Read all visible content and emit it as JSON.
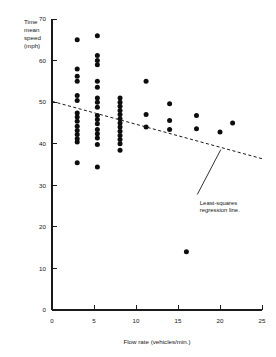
{
  "chart_data": {
    "type": "scatter",
    "title": "",
    "xlabel": "Flow rate (vehicles/min.)",
    "ylabel": "Time mean speed (mph)",
    "ylabel_lines": [
      "Time",
      "mean",
      "speed",
      "(mph)"
    ],
    "xlim": [
      0,
      25
    ],
    "ylim": [
      0,
      70
    ],
    "xticks": [
      0,
      5,
      10,
      15,
      20,
      25
    ],
    "yticks": [
      0,
      10,
      20,
      30,
      40,
      50,
      60,
      70
    ],
    "xtick_labels": [
      "0",
      "5",
      "10",
      "15",
      "20",
      "25"
    ],
    "ytick_labels": [
      "0",
      "10",
      "20",
      "30",
      "40",
      "50",
      "60",
      "70"
    ],
    "grid": false,
    "legend": null,
    "annotations": [
      {
        "name": "regression-line-annotation",
        "text_lines": [
          "Least-squares",
          "regression line."
        ],
        "text_x": 17.6,
        "text_y": 25.3,
        "leader_from_x": 17.3,
        "leader_from_y": 27.8,
        "leader_to_x": 20.1,
        "leader_to_y": 38.6
      }
    ],
    "series": [
      {
        "name": "Observations",
        "marker": "filled-circle",
        "color": "#0d0d0d",
        "points": [
          [
            3.0,
            65.0
          ],
          [
            5.4,
            66.0
          ],
          [
            3.0,
            58.0
          ],
          [
            5.4,
            61.2
          ],
          [
            5.4,
            60.0
          ],
          [
            5.4,
            59.0
          ],
          [
            3.0,
            56.2
          ],
          [
            3.0,
            55.0
          ],
          [
            5.4,
            55.0
          ],
          [
            5.4,
            53.6
          ],
          [
            11.2,
            55.0
          ],
          [
            3.0,
            51.6
          ],
          [
            3.0,
            50.4
          ],
          [
            5.4,
            51.0
          ],
          [
            5.4,
            50.0
          ],
          [
            5.4,
            48.8
          ],
          [
            8.1,
            51.0
          ],
          [
            8.1,
            50.0
          ],
          [
            8.1,
            49.0
          ],
          [
            8.1,
            48.0
          ],
          [
            8.1,
            47.0
          ],
          [
            14.0,
            49.6
          ],
          [
            3.0,
            47.4
          ],
          [
            3.0,
            46.4
          ],
          [
            3.0,
            45.4
          ],
          [
            5.4,
            46.8
          ],
          [
            5.4,
            45.8
          ],
          [
            5.4,
            44.8
          ],
          [
            8.1,
            46.0
          ],
          [
            8.1,
            45.0
          ],
          [
            8.1,
            44.0
          ],
          [
            11.2,
            47.0
          ],
          [
            14.0,
            45.6
          ],
          [
            17.2,
            46.8
          ],
          [
            21.5,
            45.0
          ],
          [
            3.0,
            44.2
          ],
          [
            3.0,
            43.2
          ],
          [
            3.0,
            42.2
          ],
          [
            3.0,
            41.2
          ],
          [
            3.0,
            40.4
          ],
          [
            5.4,
            43.4
          ],
          [
            5.4,
            42.4
          ],
          [
            5.4,
            41.4
          ],
          [
            8.1,
            43.0
          ],
          [
            8.1,
            42.0
          ],
          [
            8.1,
            41.0
          ],
          [
            8.1,
            40.0
          ],
          [
            11.2,
            44.0
          ],
          [
            14.0,
            43.4
          ],
          [
            17.2,
            43.6
          ],
          [
            20.0,
            42.8
          ],
          [
            5.4,
            39.8
          ],
          [
            8.1,
            38.4
          ],
          [
            3.0,
            35.4
          ],
          [
            5.4,
            34.4
          ],
          [
            16.0,
            14.0
          ]
        ]
      }
    ],
    "regression_line": {
      "name": "Least-squares regression line",
      "style": "dashed",
      "x_start": 0.0,
      "y_start": 50.2,
      "x_end": 25.0,
      "y_end": 36.4
    }
  }
}
